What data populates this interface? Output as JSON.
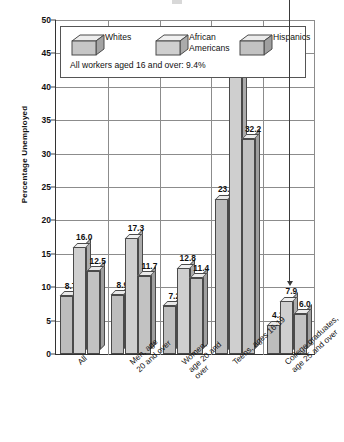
{
  "chart_data": {
    "type": "bar",
    "title": "",
    "subtitle": "",
    "xlabel": "",
    "ylabel": "Percentage Unemployed",
    "ylim": [
      0,
      50
    ],
    "ytick_step": 5,
    "yticks": [
      "0",
      "5",
      "10",
      "15",
      "20",
      "25",
      "30",
      "35",
      "40",
      "45",
      "50"
    ],
    "grid": true,
    "legend_position": "top-inside",
    "categories": [
      "All",
      "Men, age 20 and over",
      "Women, age 20 and over",
      "Teens, ages 16-19",
      "College graduates, age 25 and over"
    ],
    "category_lines": [
      [
        "All"
      ],
      [
        "Men, age",
        "20 and over"
      ],
      [
        "Women,",
        "age 20 and",
        "over"
      ],
      [
        "Teens, ages 16-19"
      ],
      [
        "College graduates,",
        "age 25 and over"
      ]
    ],
    "series": [
      {
        "name": "Whites",
        "key": "s-white",
        "values": [
          8.7,
          8.9,
          7.2,
          23.2,
          4.3
        ]
      },
      {
        "name": "African Americans",
        "key": "s-aa",
        "values": [
          16.0,
          17.3,
          12.8,
          43.0,
          7.9
        ]
      },
      {
        "name": "Hispanics",
        "key": "s-hisp",
        "values": [
          12.5,
          11.7,
          11.4,
          32.2,
          6.0
        ]
      }
    ],
    "value_labels": [
      [
        "8.7",
        "16.0",
        "12.5"
      ],
      [
        "8.9",
        "17.3",
        "11.7"
      ],
      [
        "7.2",
        "12.8",
        "11.4"
      ],
      [
        "23.2",
        "43.0",
        "32.2"
      ],
      [
        "4.3",
        "7.9",
        "6.0"
      ]
    ],
    "annotations": [
      {
        "name": "all-workers-note",
        "text": "All workers aged 16 and over: 9.4%"
      }
    ],
    "colors": {
      "whites_front": "#bdbdbd",
      "african_americans_front": "#cfcfcf",
      "hispanics_front": "#c2c2c2",
      "bar_outline": "#4a4a4a",
      "gridline": "#8c8c8c",
      "axis": "#333333",
      "background": "#ffffff"
    }
  },
  "legend": {
    "items": [
      {
        "label_line1": "Whites",
        "label_line2": ""
      },
      {
        "label_line1": "African",
        "label_line2": "Americans"
      },
      {
        "label_line1": "Hispanics",
        "label_line2": ""
      }
    ]
  }
}
